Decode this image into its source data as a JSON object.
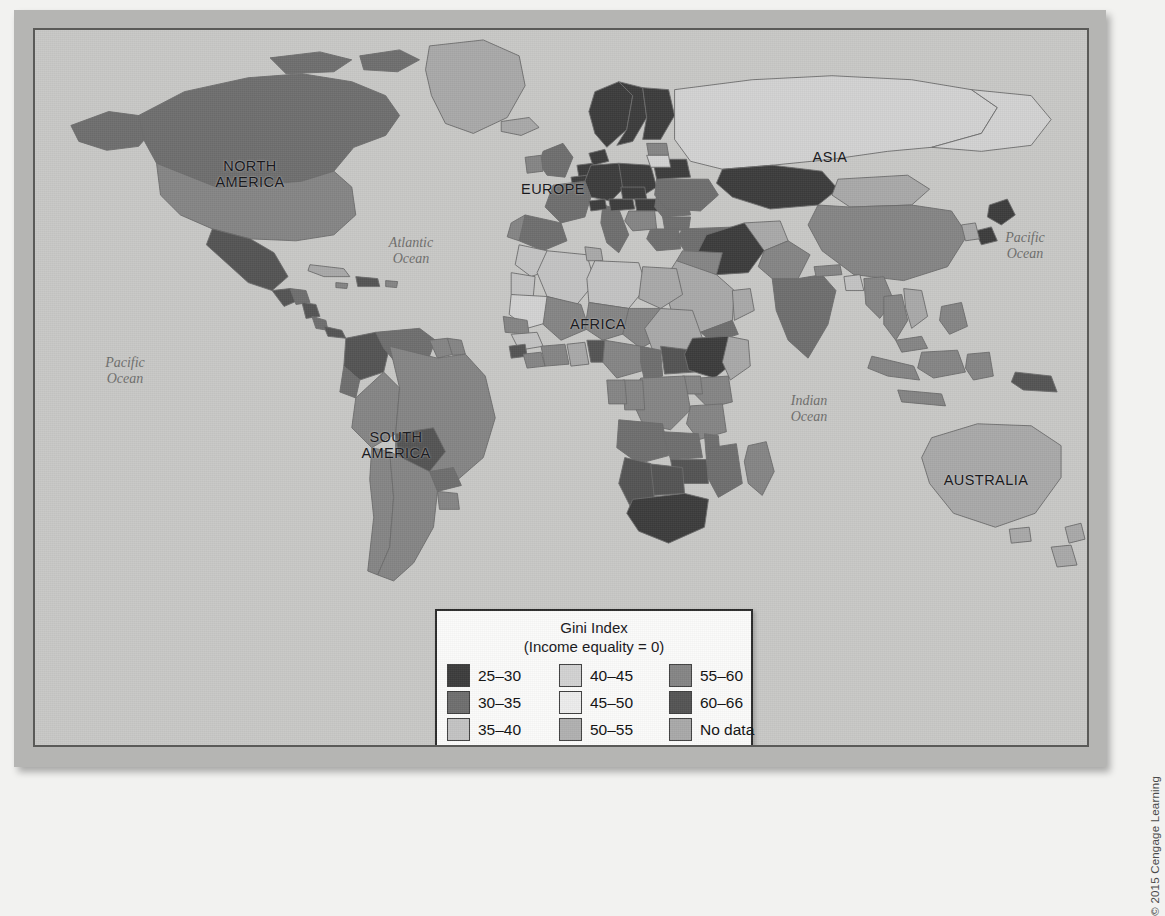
{
  "figure": {
    "kind": "world-choropleth-map",
    "ocean_color": "#c8c8c6",
    "frame_color": "#b5b5b3",
    "border_color": "#5a5a58"
  },
  "continent_labels": [
    {
      "name": "north-america",
      "text": "NORTH\nAMERICA",
      "x": 160,
      "y": 129
    },
    {
      "name": "south-america",
      "text": "SOUTH\nAMERICA",
      "x": 306,
      "y": 400
    },
    {
      "name": "europe",
      "text": "EUROPE",
      "x": 473,
      "y": 152
    },
    {
      "name": "africa",
      "text": "AFRICA",
      "x": 518,
      "y": 287
    },
    {
      "name": "asia",
      "text": "ASIA",
      "x": 760,
      "y": 120
    },
    {
      "name": "australia",
      "text": "AUSTRALIA",
      "x": 896,
      "y": 443
    }
  ],
  "ocean_labels": [
    {
      "name": "pacific-ocean-west",
      "text": "Pacific\nOcean",
      "x": 50,
      "y": 325
    },
    {
      "name": "atlantic-ocean",
      "text": "Atlantic\nOcean",
      "x": 336,
      "y": 205
    },
    {
      "name": "indian-ocean",
      "text": "Indian\nOcean",
      "x": 734,
      "y": 363
    },
    {
      "name": "pacific-ocean-east",
      "text": "Pacific\nOcean",
      "x": 950,
      "y": 200
    }
  ],
  "legend": {
    "title": "Gini Index\n(Income equality = 0)",
    "items": [
      {
        "label": "25–30",
        "color": "#3c3c3c"
      },
      {
        "label": "30–35",
        "color": "#6e6e6e"
      },
      {
        "label": "35–40",
        "color": "#c3c3c3"
      },
      {
        "label": "40–45",
        "color": "#d2d2d2"
      },
      {
        "label": "45–50",
        "color": "#ececec"
      },
      {
        "label": "50–55",
        "color": "#b0b0b0"
      },
      {
        "label": "55–60",
        "color": "#858585"
      },
      {
        "label": "60–66",
        "color": "#545454"
      },
      {
        "label": "No data",
        "color": "#a8a8a8"
      }
    ]
  },
  "copyright": {
    "text": "© 2015 Cengage Learning"
  },
  "chart_data": {
    "type": "map",
    "title": "Gini Index",
    "subtitle": "(Income equality = 0)",
    "legend_position": "bottom-center",
    "classes": [
      {
        "range": "25–30",
        "min": 25,
        "max": 30,
        "color": "#3c3c3c"
      },
      {
        "range": "30–35",
        "min": 30,
        "max": 35,
        "color": "#6e6e6e"
      },
      {
        "range": "35–40",
        "min": 35,
        "max": 40,
        "color": "#c3c3c3"
      },
      {
        "range": "40–45",
        "min": 40,
        "max": 45,
        "color": "#d2d2d2"
      },
      {
        "range": "45–50",
        "min": 45,
        "max": 50,
        "color": "#ececec"
      },
      {
        "range": "50–55",
        "min": 50,
        "max": 55,
        "color": "#b0b0b0"
      },
      {
        "range": "55–60",
        "min": 55,
        "max": 60,
        "color": "#858585"
      },
      {
        "range": "60–66",
        "min": 60,
        "max": 66,
        "color": "#545454"
      },
      {
        "range": "No data",
        "min": null,
        "max": null,
        "color": "#a8a8a8"
      }
    ],
    "continents": [
      "NORTH AMERICA",
      "SOUTH AMERICA",
      "EUROPE",
      "AFRICA",
      "ASIA",
      "AUSTRALIA"
    ],
    "oceans": [
      "Pacific Ocean",
      "Atlantic Ocean",
      "Indian Ocean",
      "Pacific Ocean"
    ]
  }
}
